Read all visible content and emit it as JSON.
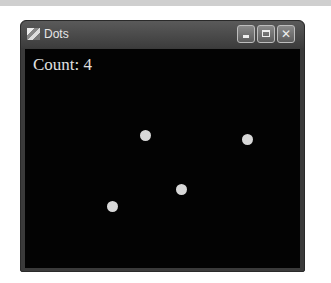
{
  "window": {
    "title": "Dots",
    "controls": {
      "minimize": "minimize",
      "maximize": "maximize",
      "close": "✕"
    }
  },
  "canvas": {
    "count_label": "Count: 4",
    "background": "#030303",
    "dot_color": "#d8d8d8",
    "dots": [
      {
        "x": 145,
        "y": 135
      },
      {
        "x": 247,
        "y": 139
      },
      {
        "x": 181,
        "y": 189
      },
      {
        "x": 112,
        "y": 206
      }
    ]
  }
}
